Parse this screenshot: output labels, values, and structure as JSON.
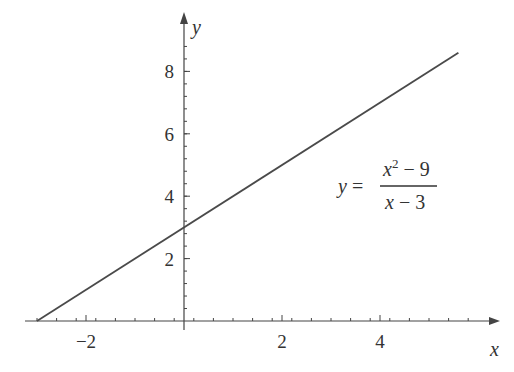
{
  "chart_data": {
    "type": "line",
    "title": "",
    "xlabel": "x",
    "ylabel": "y",
    "xlim": [
      -3.2,
      6.5
    ],
    "ylim": [
      0,
      9.5
    ],
    "grid": false,
    "legend": null,
    "x_ticks": [
      -2,
      2,
      4
    ],
    "x_tick_labels": [
      "−2",
      "2",
      "4"
    ],
    "y_ticks": [
      2,
      4,
      6,
      8
    ],
    "y_tick_labels": [
      "2",
      "4",
      "6",
      "8"
    ],
    "series": [
      {
        "name": "y = (x^2 - 9)/(x - 3)",
        "x": [
          -3,
          5.6
        ],
        "y": [
          0,
          8.6
        ],
        "color": "#4a4a4a"
      }
    ],
    "annotations": [
      {
        "text": "y = (x² − 9)/(x − 3)",
        "lhs": "y =",
        "numerator_base": "x",
        "numerator_exp": "2",
        "numerator_rest": " − 9",
        "denominator": "x − 3",
        "position": [
          3.3,
          3.9
        ]
      }
    ]
  }
}
